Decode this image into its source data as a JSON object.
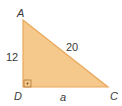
{
  "figure": {
    "type": "right-triangle",
    "vertices": {
      "A": {
        "label": "A"
      },
      "D": {
        "label": "D"
      },
      "C": {
        "label": "C"
      }
    },
    "sides": {
      "AD": {
        "label": "12"
      },
      "AC": {
        "label": "20"
      },
      "DC": {
        "label": "a"
      }
    },
    "right_angle_at": "D",
    "colors": {
      "fill": "#f5c98c",
      "stroke": "#e9a85a",
      "text": "#3a3a3a"
    }
  }
}
